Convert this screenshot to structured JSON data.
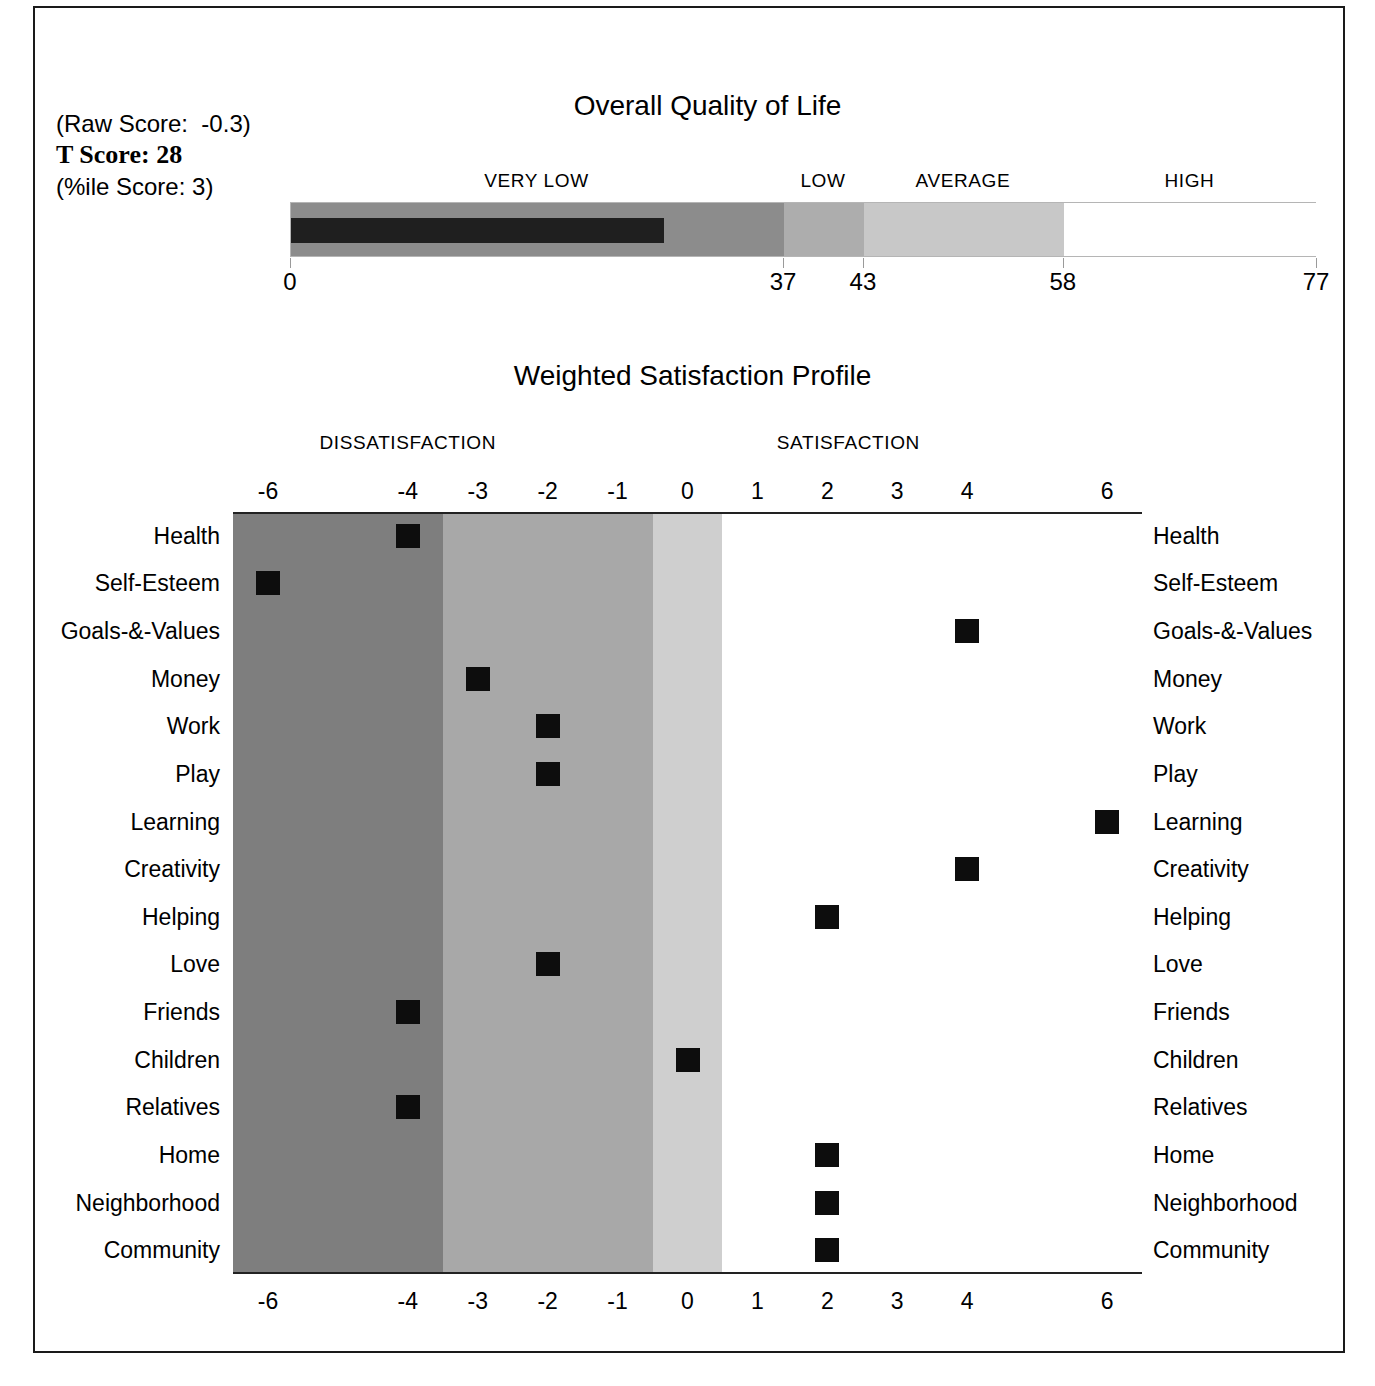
{
  "scores": {
    "raw_score": "(Raw Score:  -0.3)",
    "t_score": "T Score: 28",
    "pctile_score": "(%ile Score: 3)"
  },
  "overall_quality_of_life": {
    "title": "Overall Quality of Life",
    "categories": [
      {
        "label": "VERY LOW",
        "center": 18.5
      },
      {
        "label": "LOW",
        "center": 40.0
      },
      {
        "label": "AVERAGE",
        "center": 50.5
      },
      {
        "label": "HIGH",
        "center": 67.5
      }
    ],
    "segments": [
      {
        "name": "very-low",
        "from": 0,
        "to": 37,
        "color": "#8c8c8c"
      },
      {
        "name": "low",
        "from": 37,
        "to": 43,
        "color": "#adadad"
      },
      {
        "name": "average",
        "from": 43,
        "to": 58,
        "color": "#c8c8c8"
      },
      {
        "name": "high",
        "from": 58,
        "to": 77,
        "color": "#ffffff"
      }
    ],
    "fill": {
      "value": 28,
      "color": "#1f1f1f"
    },
    "ticks": [
      0,
      37,
      43,
      58,
      77
    ],
    "axis_min": 0,
    "axis_max": 77
  },
  "weighted_satisfaction_profile": {
    "title": "Weighted Satisfaction Profile",
    "headers": [
      {
        "label": "DISSATISFACTION",
        "at": -4.0
      },
      {
        "label": "SATISFACTION",
        "at": 2.3
      }
    ],
    "tick_labels": [
      "-6",
      "-4",
      "-3",
      "-2",
      "-1",
      "0",
      "1",
      "2",
      "3",
      "4",
      "6"
    ],
    "tick_values": [
      -6,
      -4,
      -3,
      -2,
      -1,
      0,
      1,
      2,
      3,
      4,
      6
    ],
    "bands": [
      {
        "name": "severe",
        "from": -6.5,
        "to": -3.5,
        "color": "#7e7e7e"
      },
      {
        "name": "moderate",
        "from": -3.5,
        "to": -0.5,
        "color": "#a8a8a8"
      },
      {
        "name": "mild",
        "from": -0.5,
        "to": 0.5,
        "color": "#cfcfcf"
      },
      {
        "name": "satisfied",
        "from": 0.5,
        "to": 6.5,
        "color": "#ffffff"
      }
    ],
    "rows": [
      {
        "label": "Health",
        "value": -4
      },
      {
        "label": "Self-Esteem",
        "value": -6
      },
      {
        "label": "Goals-&-Values",
        "value": 4
      },
      {
        "label": "Money",
        "value": -3
      },
      {
        "label": "Work",
        "value": -2
      },
      {
        "label": "Play",
        "value": -2
      },
      {
        "label": "Learning",
        "value": 6
      },
      {
        "label": "Creativity",
        "value": 4
      },
      {
        "label": "Helping",
        "value": 2
      },
      {
        "label": "Love",
        "value": -2
      },
      {
        "label": "Friends",
        "value": -4
      },
      {
        "label": "Children",
        "value": 0
      },
      {
        "label": "Relatives",
        "value": -4
      },
      {
        "label": "Home",
        "value": 2
      },
      {
        "label": "Neighborhood",
        "value": 2
      },
      {
        "label": "Community",
        "value": 2
      }
    ]
  },
  "chart_data": {
    "type": "scatter",
    "title": "Weighted Satisfaction Profile",
    "xlabel": "",
    "ylabel": "",
    "xlim": [
      -6.5,
      6.5
    ],
    "grid": false,
    "legend": "none",
    "categories": [
      "Health",
      "Self-Esteem",
      "Goals-&-Values",
      "Money",
      "Work",
      "Play",
      "Learning",
      "Creativity",
      "Helping",
      "Love",
      "Friends",
      "Children",
      "Relatives",
      "Home",
      "Neighborhood",
      "Community"
    ],
    "values": [
      -4,
      -6,
      4,
      -3,
      -2,
      -2,
      6,
      4,
      2,
      -2,
      -4,
      0,
      -4,
      2,
      2,
      2
    ],
    "x_tick_labels": [
      "-6",
      "-4",
      "-3",
      "-2",
      "-1",
      "0",
      "1",
      "2",
      "3",
      "4",
      "6"
    ],
    "annotations": [
      "DISSATISFACTION",
      "SATISFACTION"
    ],
    "secondary_chart": {
      "type": "bar",
      "title": "Overall Quality of Life",
      "categories": [
        "VERY LOW",
        "LOW",
        "AVERAGE",
        "HIGH"
      ],
      "category_ranges": [
        [
          0,
          37
        ],
        [
          37,
          43
        ],
        [
          43,
          58
        ],
        [
          58,
          77
        ]
      ],
      "values": [
        28
      ],
      "value_label": "T Score: 28",
      "raw_score": -0.3,
      "percentile_score": 3,
      "xlim": [
        0,
        77
      ],
      "x_tick_labels": [
        "0",
        "37",
        "43",
        "58",
        "77"
      ]
    }
  }
}
